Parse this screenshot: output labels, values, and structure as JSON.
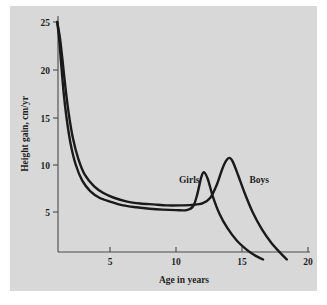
{
  "figure": {
    "background_color": "#d8d8d8",
    "page_color": "#ffffff",
    "curve_color": "#1a1a1a",
    "axis_color": "#4a4a4a"
  },
  "chart_data": {
    "type": "line",
    "title": "",
    "subtitle": "",
    "xlabel": "Age in years",
    "ylabel": "Height gain, cm/yr",
    "xlim": [
      0.8,
      20
    ],
    "ylim": [
      0,
      25
    ],
    "xticks": [
      5,
      10,
      15,
      20
    ],
    "xticklabels": [
      "5",
      "10",
      "15",
      "20"
    ],
    "yticks": [
      5,
      10,
      15,
      20,
      25
    ],
    "yticklabels": [
      "5",
      "10",
      "15",
      "20",
      "25"
    ],
    "grid": false,
    "legend_position": "inline-annotations",
    "annotations": [
      {
        "text": "Girls",
        "x": 11.0,
        "y": 8.1
      },
      {
        "text": "Boys",
        "x": 16.3,
        "y": 8.1
      }
    ],
    "series": [
      {
        "name": "Girls",
        "x": [
          1.0,
          1.15,
          1.3,
          1.5,
          1.7,
          2.0,
          2.4,
          2.9,
          3.5,
          4.2,
          5.0,
          6.0,
          7.0,
          8.0,
          9.0,
          10.0,
          10.8,
          11.3,
          11.6,
          11.9,
          12.1,
          12.4,
          12.8,
          13.3,
          13.9,
          14.6,
          15.3,
          15.9,
          16.3,
          16.6
        ],
        "y": [
          25.0,
          23.2,
          20.6,
          17.4,
          15.0,
          12.3,
          10.0,
          8.3,
          7.2,
          6.5,
          6.1,
          5.7,
          5.5,
          5.35,
          5.25,
          5.2,
          5.2,
          5.6,
          6.8,
          8.6,
          9.2,
          8.5,
          6.6,
          4.8,
          3.3,
          2.0,
          1.1,
          0.5,
          0.2,
          0.0
        ]
      },
      {
        "name": "Boys",
        "x": [
          1.0,
          1.2,
          1.4,
          1.6,
          1.85,
          2.2,
          2.6,
          3.1,
          3.8,
          4.5,
          5.3,
          6.3,
          7.3,
          8.3,
          9.3,
          10.3,
          11.2,
          12.0,
          12.6,
          13.1,
          13.5,
          13.8,
          14.05,
          14.3,
          14.7,
          15.2,
          15.8,
          16.5,
          17.2,
          17.9,
          18.4
        ],
        "y": [
          25.0,
          23.4,
          21.0,
          18.4,
          15.6,
          12.7,
          10.6,
          8.9,
          7.7,
          7.0,
          6.5,
          6.1,
          5.9,
          5.8,
          5.7,
          5.7,
          5.75,
          5.9,
          6.5,
          7.9,
          9.5,
          10.4,
          10.7,
          10.3,
          8.9,
          7.0,
          5.0,
          3.2,
          1.8,
          0.7,
          0.0
        ]
      }
    ],
    "peaks": [
      {
        "series": "Girls",
        "age": 12.1,
        "value": 9.2
      },
      {
        "series": "Boys",
        "age": 14.05,
        "value": 10.7
      }
    ]
  }
}
